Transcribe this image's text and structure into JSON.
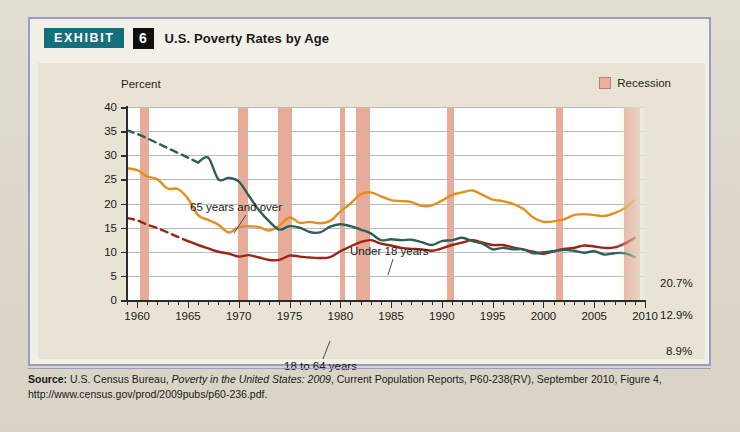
{
  "exhibit": {
    "badge_label": "EXHIBIT",
    "number": "6",
    "title": "U.S. Poverty Rates by Age"
  },
  "legend": {
    "items": [
      {
        "label": "Recession",
        "color": "#e8b0a0",
        "icon": "square-swatch-icon"
      }
    ]
  },
  "axis": {
    "y_title": "Percent"
  },
  "source": {
    "label": "Source:",
    "text_1": " U.S. Census Bureau, ",
    "italic_1": "Poverty in the United States: 2009",
    "text_2": ", Current Population Reports, P60-238(RV), September 2010, Figure 4, http://www.census.gov/prod/2009pubs/p60-236.pdf."
  },
  "chart_data": {
    "type": "line",
    "title": "U.S. Poverty Rates by Age",
    "xlabel": "",
    "ylabel": "Percent",
    "xlim": [
      1959,
      2010
    ],
    "ylim": [
      0,
      40
    ],
    "yticks": [
      0,
      5,
      10,
      15,
      20,
      25,
      30,
      35,
      40
    ],
    "xticks": [
      1960,
      1965,
      1970,
      1975,
      1980,
      1985,
      1990,
      1995,
      2000,
      2005,
      2010
    ],
    "grid": true,
    "legend_position": "top-right",
    "series": [
      {
        "name": "Under 18 years",
        "color": "#e09020",
        "annotation": "Under 18 years",
        "end_label": "20.7%",
        "x": [
          1959,
          1960,
          1961,
          1962,
          1963,
          1964,
          1965,
          1966,
          1967,
          1968,
          1969,
          1970,
          1971,
          1972,
          1973,
          1974,
          1975,
          1976,
          1977,
          1978,
          1979,
          1980,
          1981,
          1982,
          1983,
          1984,
          1985,
          1986,
          1987,
          1988,
          1989,
          1990,
          1991,
          1992,
          1993,
          1994,
          1995,
          1996,
          1997,
          1998,
          1999,
          2000,
          2001,
          2002,
          2003,
          2004,
          2005,
          2006,
          2007,
          2008,
          2009
        ],
        "values": [
          27.3,
          26.9,
          25.6,
          25.0,
          23.1,
          23.0,
          21.0,
          17.6,
          16.6,
          15.6,
          14.0,
          15.1,
          15.3,
          15.1,
          14.4,
          15.4,
          17.1,
          16.0,
          16.2,
          15.9,
          16.4,
          18.3,
          20.0,
          21.9,
          22.3,
          21.5,
          20.7,
          20.5,
          20.3,
          19.5,
          19.6,
          20.6,
          21.8,
          22.3,
          22.7,
          21.8,
          20.8,
          20.5,
          19.9,
          18.9,
          17.1,
          16.2,
          16.3,
          16.7,
          17.6,
          17.8,
          17.6,
          17.4,
          18.0,
          19.0,
          20.7
        ]
      },
      {
        "name": "18 to 64 years",
        "color": "#9b2418",
        "annotation": "18 to 64 years",
        "end_label": "12.9%",
        "dashed_until": 1965,
        "x": [
          1959,
          1960,
          1961,
          1962,
          1963,
          1964,
          1965,
          1966,
          1967,
          1968,
          1969,
          1970,
          1971,
          1972,
          1973,
          1974,
          1975,
          1976,
          1977,
          1978,
          1979,
          1980,
          1981,
          1982,
          1983,
          1984,
          1985,
          1986,
          1987,
          1988,
          1989,
          1990,
          1991,
          1992,
          1993,
          1994,
          1995,
          1996,
          1997,
          1998,
          1999,
          2000,
          2001,
          2002,
          2003,
          2004,
          2005,
          2006,
          2007,
          2008,
          2009
        ],
        "values": [
          17.0,
          16.5,
          15.6,
          14.9,
          14.0,
          13.1,
          12.2,
          11.4,
          10.7,
          10.0,
          9.6,
          9.0,
          9.3,
          8.8,
          8.3,
          8.3,
          9.2,
          9.0,
          8.8,
          8.7,
          8.9,
          10.1,
          11.1,
          12.0,
          12.4,
          11.7,
          11.3,
          10.8,
          10.6,
          10.5,
          10.2,
          10.7,
          11.4,
          11.9,
          12.4,
          11.9,
          11.4,
          11.4,
          10.9,
          10.5,
          10.0,
          9.6,
          10.1,
          10.6,
          10.8,
          11.3,
          11.1,
          10.8,
          10.9,
          11.7,
          12.9
        ]
      },
      {
        "name": "65 years and over",
        "color": "#2f5e52",
        "annotation": "65 years and over",
        "end_label": "8.9%",
        "dashed_until": 1966,
        "x": [
          1959,
          1960,
          1961,
          1962,
          1963,
          1964,
          1965,
          1966,
          1967,
          1968,
          1969,
          1970,
          1971,
          1972,
          1973,
          1974,
          1975,
          1976,
          1977,
          1978,
          1979,
          1980,
          1981,
          1982,
          1983,
          1984,
          1985,
          1986,
          1987,
          1988,
          1989,
          1990,
          1991,
          1992,
          1993,
          1994,
          1995,
          1996,
          1997,
          1998,
          1999,
          2000,
          2001,
          2002,
          2003,
          2004,
          2005,
          2006,
          2007,
          2008,
          2009
        ],
        "values": [
          35.2,
          34.4,
          33.5,
          32.5,
          31.5,
          30.5,
          29.5,
          28.5,
          29.5,
          25.0,
          25.3,
          24.6,
          21.6,
          18.6,
          16.3,
          14.6,
          15.3,
          15.0,
          14.1,
          14.0,
          15.2,
          15.7,
          15.3,
          14.6,
          13.8,
          12.4,
          12.6,
          12.4,
          12.5,
          12.0,
          11.4,
          12.2,
          12.4,
          12.9,
          12.2,
          11.7,
          10.5,
          10.8,
          10.5,
          10.5,
          9.7,
          9.9,
          10.1,
          10.4,
          10.2,
          9.8,
          10.1,
          9.4,
          9.7,
          9.7,
          8.9
        ]
      }
    ],
    "recessions": [
      {
        "start": 1960.3,
        "end": 1961.2
      },
      {
        "start": 1969.9,
        "end": 1970.9
      },
      {
        "start": 1973.9,
        "end": 1975.2
      },
      {
        "start": 1980.0,
        "end": 1980.5
      },
      {
        "start": 1981.5,
        "end": 1982.9
      },
      {
        "start": 1990.5,
        "end": 1991.2
      },
      {
        "start": 2001.2,
        "end": 2001.9
      },
      {
        "start": 2007.9,
        "end": 2009.5
      }
    ]
  }
}
